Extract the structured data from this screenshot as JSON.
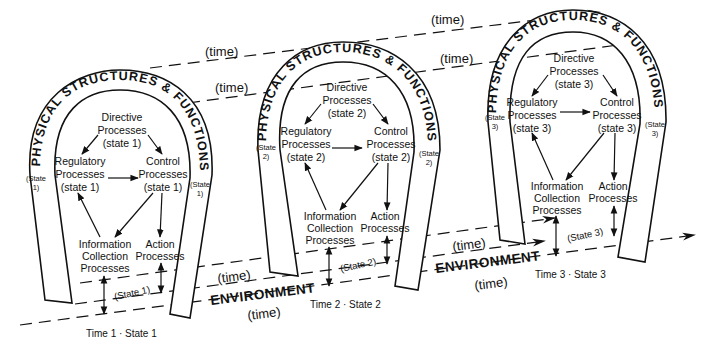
{
  "diagram": {
    "arch_title": "PHYSICAL STRUCTURES & FUNCTIONS",
    "environment_label": "ENVIRONMENT",
    "time_label": "(time)",
    "stages": [
      {
        "directive": [
          "Directive",
          "Processes",
          "(state  1)"
        ],
        "regulatory": [
          "Regulatory",
          "Processes",
          "(state  1)"
        ],
        "control": [
          "Control",
          "Processes",
          "(state  1)"
        ],
        "information": [
          "Information",
          "Collection",
          "Processes"
        ],
        "action": [
          "Action",
          "Processes"
        ],
        "side_state": [
          "(State",
          "1)"
        ],
        "bottom_state": "(State  1)",
        "caption": "Time 1 · State 1"
      },
      {
        "directive": [
          "Directive",
          "Processes",
          "(state  2)"
        ],
        "regulatory": [
          "Regulatory",
          "Processes",
          "(state  2)"
        ],
        "control": [
          "Control",
          "Processes",
          "(state  2)"
        ],
        "information": [
          "Information",
          "Collection",
          "Processes"
        ],
        "action": [
          "Action",
          "Processes"
        ],
        "side_state": [
          "(State",
          "2)"
        ],
        "bottom_state": "(State  2)",
        "caption": "Time 2 · State 2"
      },
      {
        "directive": [
          "Directive",
          "Processes",
          "(state  3)"
        ],
        "regulatory": [
          "Regulatory",
          "Processes",
          "(state  3)"
        ],
        "control": [
          "Control",
          "Processes",
          "(state  3)"
        ],
        "information": [
          "Information",
          "Collection",
          "Processes"
        ],
        "action": [
          "Action",
          "Processes"
        ],
        "side_state": [
          "(State",
          "3)"
        ],
        "bottom_state": "(State  3)",
        "caption": "Time 3 · State 3"
      }
    ],
    "colors": {
      "ink": "#111111",
      "background": "#ffffff"
    }
  }
}
